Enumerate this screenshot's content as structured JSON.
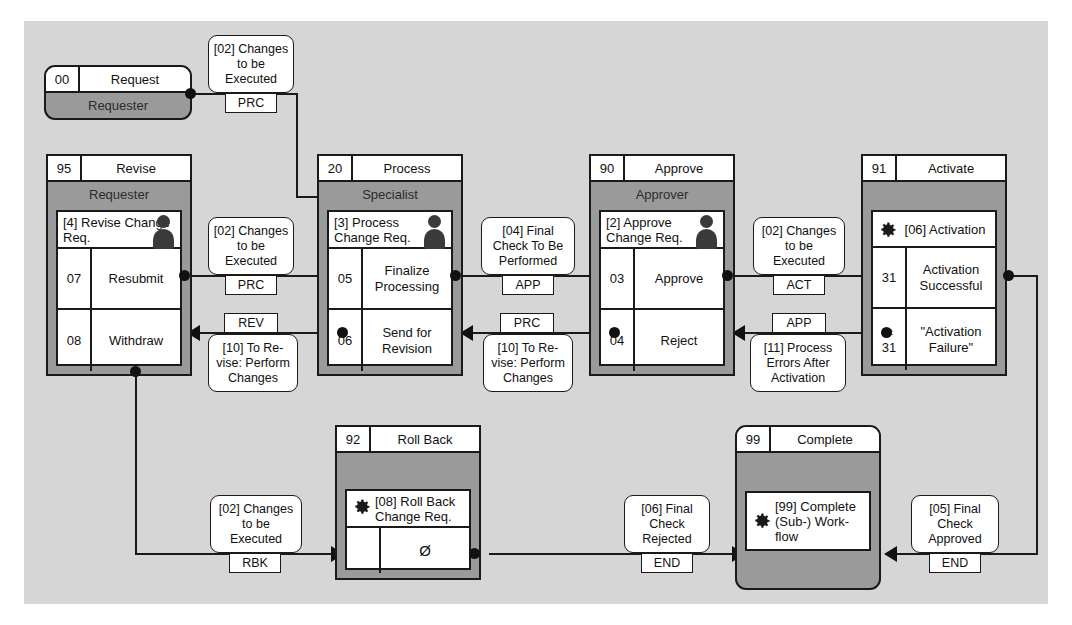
{
  "diagram": {
    "background_color": "#d6d6d6",
    "box_fill": "#9a9a9a",
    "line_color": "#1a1a1a"
  },
  "nodes": {
    "request": {
      "number": "00",
      "title": "Request",
      "role": "Requester"
    },
    "revise": {
      "number": "95",
      "title": "Revise",
      "role": "Requester",
      "task": "[4] Revise Change Req.",
      "rows": [
        {
          "code": "07",
          "label": "Resubmit"
        },
        {
          "code": "08",
          "label": "Withdraw"
        }
      ]
    },
    "process": {
      "number": "20",
      "title": "Process",
      "role": "Specialist",
      "task": "[3] Process Change Req.",
      "rows": [
        {
          "code": "05",
          "label": "Finalize Processing"
        },
        {
          "code": "06",
          "label": "Send for Revision"
        }
      ]
    },
    "approve": {
      "number": "90",
      "title": "Approve",
      "role": "Approver",
      "task": "[2] Approve Change Req.",
      "rows": [
        {
          "code": "03",
          "label": "Approve"
        },
        {
          "code": "04",
          "label": "Reject"
        }
      ]
    },
    "activate": {
      "number": "91",
      "title": "Activate",
      "role": "",
      "task": "[06] Activation",
      "rows": [
        {
          "code": "31",
          "label": "Activation Successful"
        },
        {
          "code": "≠ 31",
          "code_line1": "≠",
          "code_line2": "31",
          "label": "\"Activation Failure\""
        }
      ]
    },
    "rollback": {
      "number": "92",
      "title": "Roll Back",
      "role": "",
      "task": "[08] Roll Back Change Req.",
      "rows": [
        {
          "code": "",
          "label": "Ø"
        }
      ]
    },
    "complete": {
      "number": "99",
      "title": "Complete",
      "role": "",
      "task": "[99] Complete (Sub-) Work-flow",
      "rows": []
    }
  },
  "events": {
    "e1": {
      "text": "[02] Changes to be Executed",
      "code": "PRC"
    },
    "e2": {
      "text": "[02] Changes to be Executed",
      "code": "PRC"
    },
    "e3": {
      "text": "[04] Final Check To Be Performed",
      "code": "APP"
    },
    "e4": {
      "text": "[02] Changes to be Executed",
      "code": "ACT"
    },
    "e5": {
      "text": "[10] To Re-vise: Perform Changes",
      "code": "REV"
    },
    "e6": {
      "text": "[10] To Re-vise: Perform Changes",
      "code": "PRC"
    },
    "e7": {
      "text": "[11] Process Errors After Activation",
      "code": "APP"
    },
    "e8": {
      "text": "[02] Changes to be Executed",
      "code": "RBK"
    },
    "e9": {
      "text": "[06] Final Check Rejected",
      "code": "END"
    },
    "e10": {
      "text": "[05] Final Check Approved",
      "code": "END"
    }
  }
}
